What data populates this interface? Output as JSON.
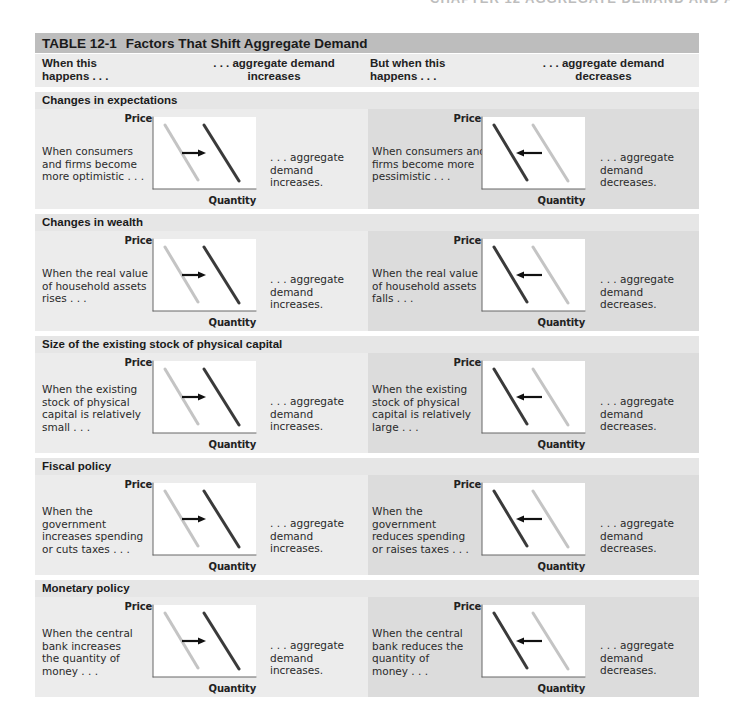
{
  "running_head": "CHAPTER 12  AGGREGATE DEMAND AND AGGREGATE SUPPLY  337",
  "table": {
    "number": "TABLE 12-1",
    "title": "Factors That Shift Aggregate Demand",
    "columns": {
      "col1_line1": "When this",
      "col1_line2": "happens . . .",
      "col2_line1": ". . . aggregate demand",
      "col2_line2": "increases",
      "col3_line1": "But when this",
      "col3_line2": "happens . . .",
      "col4_line1": ". . . aggregate demand",
      "col4_line2": "decreases"
    },
    "axis_labels": {
      "y": "Price",
      "x": "Quantity"
    },
    "colors": {
      "title_bar": "#bdbdbd",
      "left_panel": "#ececec",
      "right_panel": "#dcdcdc",
      "section_head": "#e6e6e6",
      "original_curve": "#c4c4c4",
      "shifted_curve": "#3a3a3a",
      "arrow": "#111111"
    },
    "sections": [
      {
        "heading": "Changes in expectations",
        "increase": {
          "cause": [
            "When consumers",
            "and firms become",
            "more optimistic . . ."
          ],
          "effect": [
            ". . . aggregate",
            "demand increases."
          ]
        },
        "decrease": {
          "cause": [
            "When consumers and",
            "firms become more",
            "pessimistic . . ."
          ],
          "effect": [
            ". . . aggregate",
            "demand decreases."
          ]
        }
      },
      {
        "heading": "Changes in wealth",
        "increase": {
          "cause": [
            "When the real value",
            "of household assets",
            "rises . . ."
          ],
          "effect": [
            ". . . aggregate",
            "demand increases."
          ]
        },
        "decrease": {
          "cause": [
            "When the real value",
            "of household assets",
            "falls . . ."
          ],
          "effect": [
            ". . . aggregate",
            "demand decreases."
          ]
        }
      },
      {
        "heading": "Size of the existing stock of physical capital",
        "increase": {
          "cause": [
            "When the existing",
            "stock of physical",
            "capital is relatively",
            "small . . ."
          ],
          "effect": [
            ". . . aggregate",
            "demand increases."
          ]
        },
        "decrease": {
          "cause": [
            "When the existing",
            "stock of physical",
            "capital is relatively",
            "large . . ."
          ],
          "effect": [
            ". . . aggregate",
            "demand decreases."
          ]
        }
      },
      {
        "heading": "Fiscal policy",
        "increase": {
          "cause": [
            "When the",
            "government",
            "increases spending",
            "or cuts taxes . . ."
          ],
          "effect": [
            ". . . aggregate",
            "demand increases."
          ]
        },
        "decrease": {
          "cause": [
            "When the",
            "government",
            "reduces spending",
            "or raises taxes . . ."
          ],
          "effect": [
            ". . . aggregate",
            "demand decreases."
          ]
        }
      },
      {
        "heading": "Monetary policy",
        "increase": {
          "cause": [
            "When the central",
            "bank increases",
            "the quantity of",
            "money . . ."
          ],
          "effect": [
            ". . . aggregate",
            "demand increases."
          ]
        },
        "decrease": {
          "cause": [
            "When the central",
            "bank reduces the",
            "quantity of",
            "money . . ."
          ],
          "effect": [
            ". . . aggregate",
            "demand decreases."
          ]
        }
      }
    ]
  }
}
